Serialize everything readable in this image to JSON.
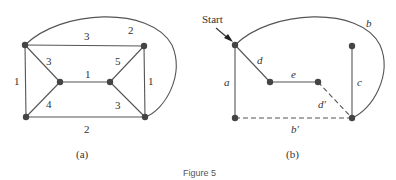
{
  "figure": {
    "caption": "Figure 5"
  },
  "panel_a": {
    "label": "(a)",
    "nodes": [
      "top-left",
      "inner-left",
      "bottom-left",
      "inner-right",
      "top-right",
      "bottom-right"
    ],
    "edges": [
      {
        "from": "top-left",
        "to": "top-right",
        "weight": "3"
      },
      {
        "from": "top-left",
        "to": "bottom-right",
        "curve": true,
        "weight": "2"
      },
      {
        "from": "top-left",
        "to": "bottom-left",
        "weight": "1"
      },
      {
        "from": "top-left",
        "to": "inner-left",
        "weight": "3"
      },
      {
        "from": "inner-left",
        "to": "inner-right",
        "weight": "1"
      },
      {
        "from": "inner-left",
        "to": "bottom-left",
        "weight": "4"
      },
      {
        "from": "inner-right",
        "to": "top-right",
        "weight": "5"
      },
      {
        "from": "inner-right",
        "to": "bottom-right",
        "weight": "3"
      },
      {
        "from": "top-right",
        "to": "bottom-right",
        "weight": "1"
      },
      {
        "from": "bottom-left",
        "to": "bottom-right",
        "weight": "2"
      }
    ]
  },
  "panel_b": {
    "label": "(b)",
    "start_label": "Start",
    "edges": [
      {
        "name": "a",
        "style": "solid"
      },
      {
        "name": "b",
        "style": "solid",
        "curve": true
      },
      {
        "name": "c",
        "style": "solid"
      },
      {
        "name": "d",
        "style": "solid"
      },
      {
        "name": "e",
        "style": "solid"
      },
      {
        "name": "d′",
        "style": "dashed"
      },
      {
        "name": "b′",
        "style": "dashed"
      }
    ]
  }
}
